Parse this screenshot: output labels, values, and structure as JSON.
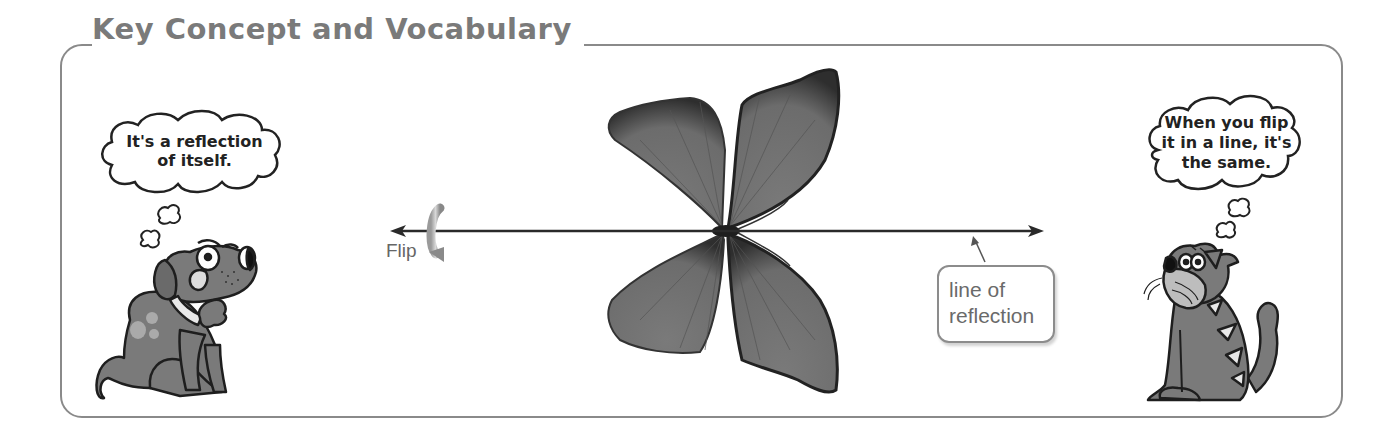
{
  "header": {
    "title": "Key Concept and Vocabulary"
  },
  "diagram": {
    "axis_label": "Flip",
    "callout": {
      "line1": "line of",
      "line2": "reflection"
    }
  },
  "characters": {
    "dog": {
      "thought_line1": "It's a reflection",
      "thought_line2": "of itself."
    },
    "cat": {
      "thought_line1": "When you flip",
      "thought_line2": "it in a line, it's",
      "thought_line3": "the same."
    }
  },
  "colors": {
    "frame": "#8a8a8a",
    "title": "#7a7a7a",
    "character_fill": "#7d7d7d",
    "butterfly_wing": "#6e6e6e",
    "line": "#2a2a2a"
  }
}
